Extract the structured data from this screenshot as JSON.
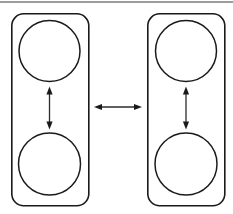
{
  "figure": {
    "title": "Two-panel diagram with paired circles and double-headed arrows",
    "canvas": {
      "width": 233,
      "height": 214,
      "background": "#ffffff"
    },
    "colors": {
      "outline": "#1a1a1a",
      "arrow": "#2b2b2b",
      "rule": "#3a3a3a",
      "background": "#ffffff"
    },
    "top_rule": {
      "x1": 0,
      "y1": 2,
      "x2": 233,
      "y2": 2
    },
    "panels": [
      {
        "id": "left-panel",
        "label": "Left panel",
        "x": 11,
        "y": 13,
        "width": 78,
        "height": 193,
        "corner_radius": 12,
        "circles": [
          {
            "id": "left-top-circle",
            "label": "Left upper circle",
            "cx": 49.5,
            "cy": 51,
            "r": 30.5
          },
          {
            "id": "left-bottom-circle",
            "label": "Left lower circle",
            "cx": 49.5,
            "cy": 164,
            "r": 31
          }
        ],
        "arrow": {
          "id": "left-vertical-arrow",
          "label": "Left vertical double-headed arrow",
          "orientation": "vertical",
          "x": 49.5,
          "y1": 88,
          "y2": 128,
          "heads": "both"
        }
      },
      {
        "id": "right-panel",
        "label": "Right panel",
        "x": 147,
        "y": 13,
        "width": 78,
        "height": 193,
        "corner_radius": 12,
        "circles": [
          {
            "id": "right-top-circle",
            "label": "Right upper circle",
            "cx": 186,
            "cy": 51,
            "r": 30.5
          },
          {
            "id": "right-bottom-circle",
            "label": "Right lower circle",
            "cx": 186,
            "cy": 164,
            "r": 31
          }
        ],
        "arrow": {
          "id": "right-vertical-arrow",
          "label": "Right vertical double-headed arrow",
          "orientation": "vertical",
          "x": 186,
          "y1": 88,
          "y2": 128,
          "heads": "both"
        }
      }
    ],
    "connector_arrow": {
      "id": "horizontal-arrow",
      "label": "Horizontal double-headed arrow between panels",
      "orientation": "horizontal",
      "y": 107,
      "x1": 95,
      "x2": 141,
      "heads": "both"
    }
  }
}
